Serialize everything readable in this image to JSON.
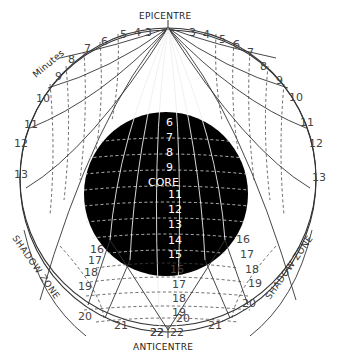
{
  "diagram": {
    "labels": {
      "epicentre": "EPICENTRE",
      "anticentre": "ANTICENTRE",
      "core": "CORE",
      "minutes": "Minutes",
      "shadow_zone_left": "SHADOW ZONE",
      "shadow_zone_right": "SHADOW ZONE"
    },
    "mantle_minutes_left": [
      "3",
      "4",
      "5",
      "6",
      "7",
      "8",
      "9",
      "10",
      "11",
      "12",
      "13"
    ],
    "mantle_minutes_right": [
      "3",
      "4",
      "5",
      "6",
      "7",
      "8",
      "9",
      "10",
      "11",
      "12",
      "13"
    ],
    "core_minutes": [
      "5",
      "6",
      "7",
      "8",
      "9",
      "10",
      "11",
      "12",
      "13",
      "14",
      "15"
    ],
    "lower_minutes_center": [
      "16",
      "17",
      "18",
      "19",
      "20",
      "22"
    ],
    "lower_minutes_left": [
      "16",
      "17",
      "18",
      "19",
      "20",
      "21",
      "22"
    ],
    "lower_minutes_right": [
      "16",
      "17",
      "18",
      "19",
      "20",
      "21",
      "22"
    ],
    "colors": {
      "background": "#ffffff",
      "core_fill": "#000000",
      "lines": "#333333"
    }
  }
}
